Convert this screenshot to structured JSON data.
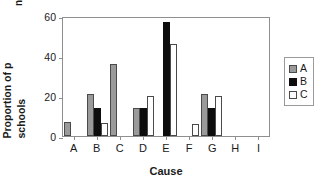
{
  "chart_data": {
    "type": "bar",
    "title": "",
    "subtitle": "",
    "xlabel": "Cause",
    "ylabel_line1": "Proportion of p",
    "ylabel_line2": "schools",
    "top_fragment": "ng",
    "categories": [
      "A",
      "B",
      "C",
      "D",
      "E",
      "F",
      "G",
      "H",
      "I"
    ],
    "series": [
      {
        "name": "A",
        "color": "#9a9a9a",
        "values": [
          7,
          21,
          36,
          14,
          0,
          0,
          21,
          0,
          0
        ]
      },
      {
        "name": "B",
        "color": "#0d0d0d",
        "values": [
          0,
          14,
          0,
          14,
          57,
          0,
          14,
          0,
          0
        ]
      },
      {
        "name": "C",
        "color": "#ffffff",
        "values": [
          0,
          6.5,
          0,
          20,
          46,
          6,
          20,
          0,
          0
        ]
      }
    ],
    "ylim": [
      0,
      60
    ],
    "yticks": [
      0,
      20,
      40,
      60
    ],
    "ytick_labels": [
      "0",
      "20",
      "40",
      "60"
    ],
    "xtick_labels": [
      "A",
      "B",
      "C",
      "D",
      "E",
      "F",
      "G",
      "H",
      "I"
    ],
    "grid": false,
    "legend_position": "right",
    "legend_entries": [
      {
        "label": "A",
        "swatch": "gray-filled"
      },
      {
        "label": "B",
        "swatch": "black-filled"
      },
      {
        "label": "C",
        "swatch": "white-open"
      }
    ]
  }
}
